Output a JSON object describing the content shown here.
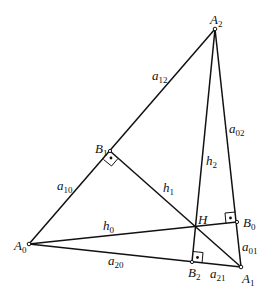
{
  "diagram": {
    "type": "triangle-orthocenter",
    "points": {
      "A0": {
        "label": "A",
        "sub": "0",
        "x": 29,
        "y": 244
      },
      "A1": {
        "label": "A",
        "sub": "1",
        "x": 241,
        "y": 267
      },
      "A2": {
        "label": "A",
        "sub": "2",
        "x": 215,
        "y": 29
      },
      "B0": {
        "label": "B",
        "sub": "0",
        "x": 237,
        "y": 222
      },
      "B1": {
        "label": "B",
        "sub": "1",
        "x": 110,
        "y": 151
      },
      "B2": {
        "label": "B",
        "sub": "2",
        "x": 192,
        "y": 262
      },
      "H": {
        "label": "H",
        "x": 195,
        "y": 227
      }
    },
    "segments": {
      "a12": {
        "label": "a",
        "sub": "12"
      },
      "a02": {
        "label": "a",
        "sub": "02"
      },
      "a10": {
        "label": "a",
        "sub": "10"
      },
      "a01": {
        "label": "a",
        "sub": "01"
      },
      "a20": {
        "label": "a",
        "sub": "20"
      },
      "a21": {
        "label": "a",
        "sub": "21"
      },
      "h0": {
        "label": "h",
        "sub": "0"
      },
      "h1": {
        "label": "h",
        "sub": "1"
      },
      "h2": {
        "label": "h",
        "sub": "2"
      }
    },
    "right_angles": [
      "B0",
      "B1",
      "B2"
    ]
  }
}
